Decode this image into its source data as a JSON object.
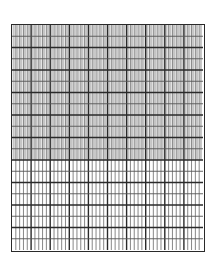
{
  "grid": {
    "major_columns": 10,
    "sub_columns_per_major": 5,
    "rows": 20,
    "thick_row_every": 2,
    "shaded_rows": 12,
    "colors": {
      "line_major": "#2a2a2a",
      "line_minor": "#555555",
      "shade": "#c4c4c4",
      "background": "#ffffff"
    }
  }
}
